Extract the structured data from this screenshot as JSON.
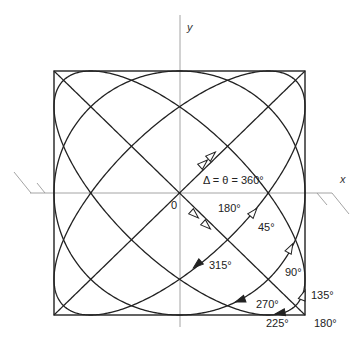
{
  "figure": {
    "axes": {
      "x_label": "x",
      "y_label": "y",
      "origin_label": "0"
    },
    "frame": {
      "left": 54,
      "right": 305,
      "top": 71,
      "bottom": 315
    },
    "center": {
      "x": 179.5,
      "y": 193
    },
    "colors": {
      "curve": "#222222",
      "axis": "#999999",
      "text": "#222222"
    },
    "curves": [
      {
        "phase_deg": 0,
        "label": "Δ = θ = 360°",
        "shape": "line"
      },
      {
        "phase_deg": 45,
        "label": "45°",
        "shape": "ellipse"
      },
      {
        "phase_deg": 90,
        "label": "90°",
        "shape": "circle"
      },
      {
        "phase_deg": 135,
        "label": "135°",
        "shape": "ellipse"
      },
      {
        "phase_deg": 180,
        "label": "180°",
        "shape": "line"
      },
      {
        "phase_deg": 225,
        "label": "225°",
        "shape": "ellipse"
      },
      {
        "phase_deg": 270,
        "label": "270°",
        "shape": "circle"
      },
      {
        "phase_deg": 315,
        "label": "315°",
        "shape": "ellipse"
      }
    ],
    "labels": {
      "delta_theta": "Δ = θ = 360°",
      "p180_inner": "180°",
      "p45": "45°",
      "p315": "315°",
      "p90": "90°",
      "p270": "270°",
      "p135": "135°",
      "p225": "225°",
      "p180_corner": "180°"
    }
  }
}
